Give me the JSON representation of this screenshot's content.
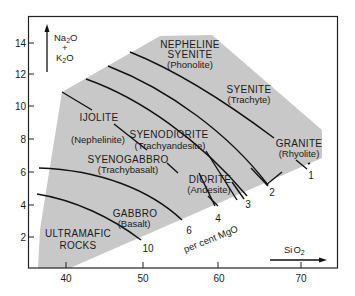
{
  "diagram": {
    "type": "TAS-style plutonic/volcanic rock classification (Na2O+K2O vs SiO2)",
    "colors": {
      "field_fill": "#c8c8c8",
      "frame": "#222222",
      "lines": "#111111",
      "background": "#ffffff"
    },
    "y_axis": {
      "label_top": "Na",
      "label_sub1": "2",
      "label_mid1": "O",
      "label_plus": "+",
      "label_k": "K",
      "label_sub2": "2",
      "label_mid2": "O",
      "ticks": [
        "2",
        "4",
        "6",
        "8",
        "10",
        "12",
        "14"
      ]
    },
    "x_axis": {
      "label": "Si",
      "label_o": "O",
      "label_sub": "2",
      "ticks": [
        "40",
        "50",
        "60",
        "70"
      ]
    },
    "fields": [
      {
        "name": "NEPHELINE",
        "name2": "SYENITE",
        "volcanic": "(Phonolite)"
      },
      {
        "name": "SYENITE",
        "volcanic": "(Trachyte)"
      },
      {
        "name": "IJOLITE",
        "volcanic": "(Nephelinite)"
      },
      {
        "name": "SYENODIORITE",
        "volcanic": "(Trachyandesite)"
      },
      {
        "name": "GRANITE",
        "volcanic": "(Rhyolite)"
      },
      {
        "name": "SYENOGABBRO",
        "volcanic": "(Trachybasalt)"
      },
      {
        "name": "DIORITE",
        "volcanic": "(Andesite)"
      },
      {
        "name": "GABBRO",
        "volcanic": "(Basalt)"
      },
      {
        "name": "ULTRAMAFIC",
        "name2": "ROCKS"
      }
    ],
    "mgo_contours": {
      "label": "per cent MgO",
      "values": [
        "10",
        "6",
        "4",
        "3",
        "2",
        "1"
      ]
    }
  }
}
